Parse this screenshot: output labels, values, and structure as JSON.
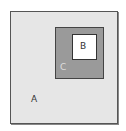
{
  "diagram": {
    "type": "nested-sets",
    "regions": [
      {
        "id": "A",
        "label": "A",
        "fill": "#e6e6e6",
        "contains": [
          "C"
        ]
      },
      {
        "id": "C",
        "label": "C",
        "fill": "#9a9a9a",
        "contains": [
          "B"
        ]
      },
      {
        "id": "B",
        "label": "B",
        "fill": "#ffffff",
        "contains": []
      }
    ],
    "labels": {
      "a": "A",
      "b": "B",
      "c": "C"
    }
  }
}
